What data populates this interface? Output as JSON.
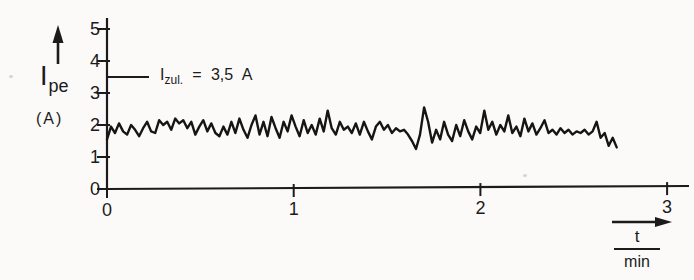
{
  "figure": {
    "background": "#fbfaf8",
    "ink": "#1b1b1b"
  },
  "y_axis": {
    "label_main": "I",
    "label_sub": "pe",
    "unit": "(A)",
    "ticks": [
      0,
      1,
      2,
      3,
      4,
      5
    ]
  },
  "x_axis": {
    "ticks": [
      0,
      1,
      2,
      3
    ],
    "unit_numerator": "t",
    "unit_denominator": "min"
  },
  "annotation": {
    "prefix": "I",
    "sub": "zul.",
    "rest": "= 3,5 A",
    "value": 3.5
  },
  "chart_data": {
    "type": "line",
    "title": "",
    "xlabel": "t (min)",
    "ylabel": "I_pe (A)",
    "xlim": [
      0,
      3.1
    ],
    "ylim": [
      0,
      5
    ],
    "x_ticks": [
      0,
      1,
      2,
      3
    ],
    "y_ticks": [
      0,
      1,
      2,
      3,
      4,
      5
    ],
    "grid": false,
    "annotations": [
      {
        "text": "I_zul. = 3,5 A",
        "y": 3.5
      }
    ],
    "series": [
      {
        "name": "I_pe",
        "t_start": 0,
        "t_end": 2.73,
        "values": [
          1.55,
          1.95,
          1.75,
          2.05,
          1.8,
          1.7,
          2.0,
          1.85,
          1.65,
          1.9,
          2.1,
          1.8,
          1.75,
          2.15,
          2.0,
          2.1,
          1.85,
          2.2,
          2.05,
          2.15,
          1.9,
          2.1,
          1.7,
          1.95,
          2.15,
          1.8,
          2.05,
          1.75,
          1.65,
          1.95,
          1.7,
          2.1,
          1.75,
          2.2,
          1.85,
          1.6,
          2.0,
          2.3,
          1.7,
          2.1,
          1.65,
          2.25,
          1.9,
          1.6,
          2.1,
          1.8,
          2.3,
          1.95,
          1.65,
          2.15,
          1.75,
          2.0,
          1.7,
          2.2,
          1.8,
          2.45,
          1.9,
          1.7,
          2.1,
          1.85,
          1.95,
          1.75,
          2.05,
          1.7,
          2.1,
          1.8,
          1.55,
          1.95,
          2.1,
          1.85,
          2.0,
          1.75,
          1.9,
          1.8,
          1.85,
          1.7,
          1.5,
          1.25,
          1.7,
          2.55,
          2.1,
          1.45,
          1.85,
          1.55,
          2.1,
          1.7,
          1.5,
          2.0,
          1.65,
          2.15,
          1.8,
          1.55,
          1.95,
          1.75,
          2.45,
          1.85,
          2.1,
          1.7,
          2.0,
          1.8,
          2.3,
          1.75,
          1.95,
          1.65,
          2.2,
          1.8,
          2.05,
          1.7,
          1.9,
          2.15,
          1.75,
          1.85,
          1.7,
          1.9,
          1.75,
          1.85,
          1.7,
          1.8,
          1.75,
          1.85,
          1.7,
          1.8,
          2.1,
          1.6,
          1.75,
          1.35,
          1.6,
          1.3
        ]
      }
    ]
  }
}
